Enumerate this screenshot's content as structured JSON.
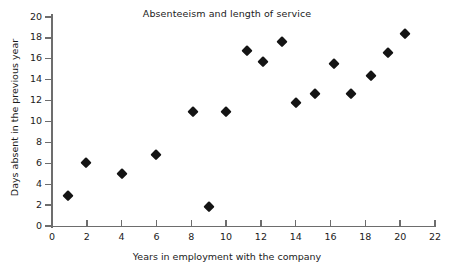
{
  "chart_data": {
    "type": "scatter",
    "title": "Absenteeism and length of service",
    "xlabel": "Years in employment with the company",
    "ylabel": "Days absent in the previous year",
    "xlim": [
      0,
      22
    ],
    "ylim": [
      0,
      20
    ],
    "xticks": [
      0,
      2,
      4,
      6,
      8,
      10,
      12,
      14,
      16,
      18,
      20,
      22
    ],
    "yticks": [
      0,
      2,
      4,
      6,
      8,
      10,
      12,
      14,
      16,
      18,
      20
    ],
    "grid": false,
    "legend": null,
    "marker": "diamond",
    "marker_color": "#141414",
    "axis_color": "#6d6d6d",
    "background": "#ffffff",
    "points": [
      {
        "x": 0.9,
        "y": 2.9
      },
      {
        "x": 1.95,
        "y": 6.0
      },
      {
        "x": 4.0,
        "y": 5.0
      },
      {
        "x": 6.0,
        "y": 6.8
      },
      {
        "x": 8.1,
        "y": 10.9
      },
      {
        "x": 9.0,
        "y": 1.8
      },
      {
        "x": 10.0,
        "y": 10.9
      },
      {
        "x": 11.2,
        "y": 16.7
      },
      {
        "x": 12.1,
        "y": 15.7
      },
      {
        "x": 13.2,
        "y": 17.6
      },
      {
        "x": 14.0,
        "y": 11.8
      },
      {
        "x": 15.1,
        "y": 12.6
      },
      {
        "x": 16.2,
        "y": 15.5
      },
      {
        "x": 17.2,
        "y": 12.6
      },
      {
        "x": 18.3,
        "y": 14.4
      },
      {
        "x": 19.3,
        "y": 16.6
      },
      {
        "x": 20.3,
        "y": 18.4
      }
    ]
  }
}
